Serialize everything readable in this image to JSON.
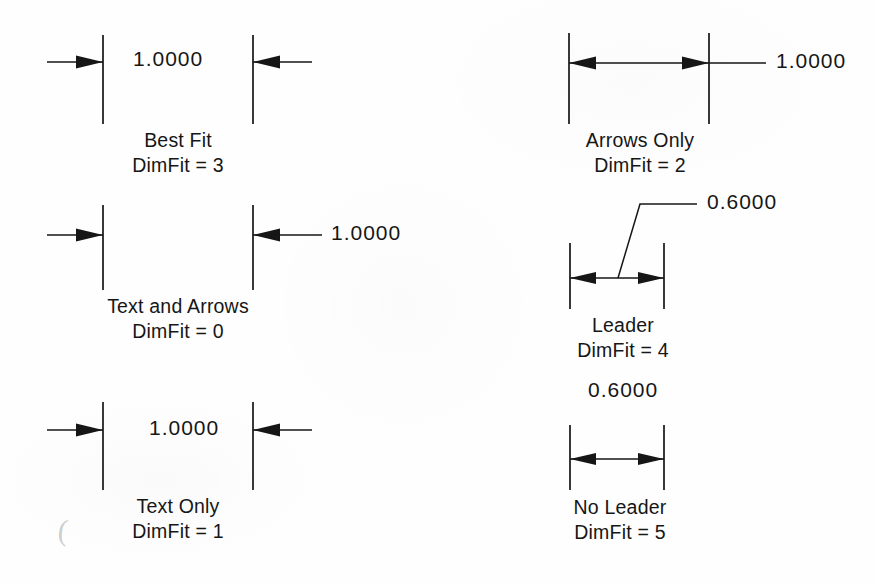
{
  "page": {
    "background_color": "#fefefe",
    "ink_color": "#161616"
  },
  "diagrams": [
    {
      "id": "best-fit",
      "title": "Best Fit",
      "code": "DimFit = 3",
      "dimension_value": "1.0000",
      "text_placement": "between-extension-lines",
      "arrow_placement": "outside-pointing-in",
      "leader": false
    },
    {
      "id": "arrows-only",
      "title": "Arrows Only",
      "code": "DimFit = 2",
      "dimension_value": "1.0000",
      "text_placement": "outside-right",
      "arrow_placement": "inside-pointing-out",
      "leader": false
    },
    {
      "id": "text-and-arrows",
      "title": "Text and Arrows",
      "code": "DimFit = 0",
      "dimension_value": "1.0000",
      "text_placement": "outside-right",
      "arrow_placement": "outside-pointing-in",
      "leader": false
    },
    {
      "id": "leader",
      "title": "Leader",
      "code": "DimFit = 4",
      "dimension_value": "0.6000",
      "text_placement": "outside-upper-right-with-leader",
      "arrow_placement": "inside-pointing-out",
      "leader": true
    },
    {
      "id": "text-only",
      "title": "Text Only",
      "code": "DimFit = 1",
      "dimension_value": "1.0000",
      "text_placement": "between-extension-lines",
      "arrow_placement": "outside-pointing-in",
      "leader": false
    },
    {
      "id": "no-leader",
      "title": "No Leader",
      "code": "DimFit = 5",
      "dimension_value": "0.6000",
      "text_placement": "above-without-leader",
      "arrow_placement": "inside-pointing-out",
      "leader": false
    }
  ]
}
